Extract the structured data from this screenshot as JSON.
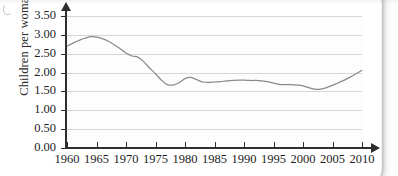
{
  "chart_data": {
    "type": "line",
    "title": "",
    "xlabel": "",
    "ylabel": "Children per woman",
    "xlim": [
      1960,
      2010
    ],
    "ylim": [
      0.0,
      3.5
    ],
    "grid": true,
    "legend": false,
    "legend_position": "none",
    "line_color": "#8a8a8a",
    "xticks": [
      1960,
      1965,
      1970,
      1975,
      1980,
      1985,
      1990,
      1995,
      2000,
      2005,
      2010
    ],
    "xtick_labels": [
      "1960",
      "1965",
      "1970",
      "1975",
      "1980",
      "1985",
      "1990",
      "1995",
      "2000",
      "2005",
      "2010"
    ],
    "yticks": [
      0.0,
      0.5,
      1.0,
      1.5,
      2.0,
      2.5,
      3.0,
      3.5
    ],
    "ytick_labels": [
      "0.00",
      "0.50",
      "1.00",
      "1.50",
      "2.00",
      "2.50",
      "3.00",
      "3.50"
    ],
    "series": [
      {
        "name": "Children per woman",
        "x": [
          1960,
          1961,
          1962,
          1963,
          1964,
          1965,
          1966,
          1967,
          1968,
          1969,
          1970,
          1971,
          1972,
          1973,
          1974,
          1975,
          1976,
          1977,
          1978,
          1979,
          1980,
          1981,
          1982,
          1983,
          1984,
          1985,
          1986,
          1987,
          1988,
          1989,
          1990,
          1991,
          1992,
          1993,
          1994,
          1995,
          1996,
          1997,
          1998,
          1999,
          2000,
          2001,
          2002,
          2003,
          2004,
          2005,
          2006,
          2007,
          2008,
          2009,
          2010
        ],
        "values": [
          2.7,
          2.78,
          2.85,
          2.91,
          2.95,
          2.94,
          2.9,
          2.83,
          2.74,
          2.63,
          2.52,
          2.44,
          2.41,
          2.29,
          2.12,
          1.97,
          1.8,
          1.68,
          1.67,
          1.73,
          1.84,
          1.87,
          1.81,
          1.75,
          1.74,
          1.75,
          1.76,
          1.78,
          1.79,
          1.8,
          1.8,
          1.79,
          1.79,
          1.78,
          1.76,
          1.72,
          1.69,
          1.68,
          1.68,
          1.67,
          1.65,
          1.6,
          1.56,
          1.56,
          1.6,
          1.66,
          1.73,
          1.8,
          1.88,
          1.97,
          2.06
        ]
      }
    ]
  }
}
